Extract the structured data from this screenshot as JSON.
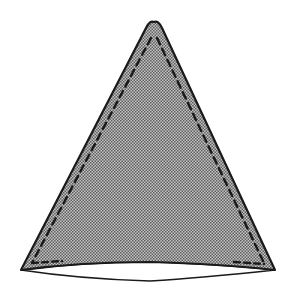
{
  "diagram": {
    "shape": "triangle-pattern-piece",
    "fill_pattern": "halftone-gray",
    "colors": {
      "background": "#ffffff",
      "outline": "#1a1a1a",
      "fill_light": "#bdbdbd",
      "fill_dark": "#6e6e6e",
      "stitch": "#1a1a1a"
    },
    "points": {
      "apex": [
        154,
        22
      ],
      "bottom_left": [
        21,
        270
      ],
      "bottom_right": [
        275,
        270
      ]
    },
    "stitch_line": "dashed",
    "bottom_edge": "curved-lens"
  }
}
